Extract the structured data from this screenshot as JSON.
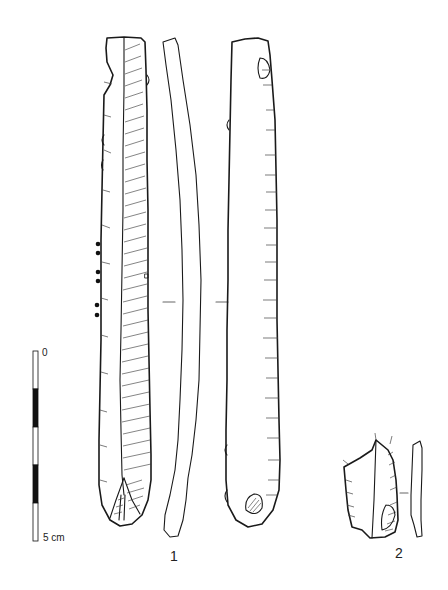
{
  "figure": {
    "artifacts": [
      {
        "number": "1",
        "description": "long blade, three views (dorsal, profile, ventral)"
      },
      {
        "number": "2",
        "description": "blade fragment, two views (dorsal, profile)"
      }
    ],
    "scale_bar": {
      "top_label": "0",
      "bottom_label": "5 cm",
      "segments": 5,
      "pattern": [
        "white",
        "black",
        "white",
        "black",
        "white"
      ]
    },
    "colors": {
      "ink": "#1a1a1a",
      "background": "#ffffff"
    }
  }
}
